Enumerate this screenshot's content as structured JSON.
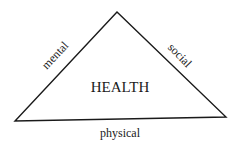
{
  "diagram": {
    "center_label": "HEALTH",
    "sides": {
      "left": "mental",
      "right": "social",
      "bottom": "physical"
    },
    "colors": {
      "line": "#1a1a1a",
      "text": "#1a1a1a",
      "background": "#ffffff"
    }
  }
}
